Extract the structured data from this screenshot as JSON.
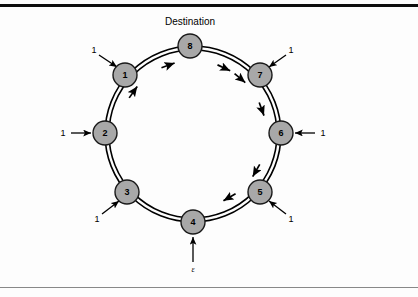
{
  "figure": {
    "caption": {
      "text": "Destination",
      "x": 190,
      "y": 22
    },
    "rules": {
      "top_color": "#0d0d0d",
      "bottom_color": "#888888"
    },
    "style": {
      "node_fill": "#a8a8a8",
      "node_stroke": "#1a1a1a",
      "ring_stroke": "#000000",
      "arrow_color": "#000000",
      "background": "#fdfdfd"
    },
    "ring": {
      "center_x": 193,
      "center_y": 134,
      "radius": 88,
      "inner_radius": 84,
      "direction": "counterclockwise",
      "double_line": true
    },
    "nodes": [
      {
        "id": "1",
        "label": "1",
        "x": 125,
        "y": 75,
        "r": 12
      },
      {
        "id": "2",
        "label": "2",
        "x": 105,
        "y": 133,
        "r": 12
      },
      {
        "id": "3",
        "label": "3",
        "x": 127,
        "y": 192,
        "r": 12
      },
      {
        "id": "4",
        "label": "4",
        "x": 193,
        "y": 222,
        "r": 12
      },
      {
        "id": "5",
        "label": "5",
        "x": 260,
        "y": 192,
        "r": 12
      },
      {
        "id": "6",
        "label": "6",
        "x": 281,
        "y": 133,
        "r": 12
      },
      {
        "id": "7",
        "label": "7",
        "x": 260,
        "y": 75,
        "r": 12
      },
      {
        "id": "8",
        "label": "8",
        "x": 190,
        "y": 46,
        "r": 12
      }
    ],
    "inputs": [
      {
        "node": "1",
        "label": "1",
        "label_x": 94,
        "label_y": 50,
        "from_x": 99,
        "from_y": 55,
        "to_x": 117,
        "to_y": 67
      },
      {
        "node": "2",
        "label": "1",
        "label_x": 63,
        "label_y": 133,
        "from_x": 71,
        "from_y": 133,
        "to_x": 91,
        "to_y": 133
      },
      {
        "node": "3",
        "label": "1",
        "label_x": 97,
        "label_y": 219,
        "from_x": 102,
        "from_y": 214,
        "to_x": 119,
        "to_y": 201
      },
      {
        "node": "4",
        "label": "ε",
        "label_x": 193,
        "label_y": 270,
        "from_x": 193,
        "from_y": 262,
        "to_x": 193,
        "to_y": 237
      },
      {
        "node": "5",
        "label": "1",
        "label_x": 291,
        "label_y": 219,
        "from_x": 286,
        "from_y": 214,
        "to_x": 269,
        "to_y": 201
      },
      {
        "node": "6",
        "label": "1",
        "label_x": 323,
        "label_y": 133,
        "from_x": 315,
        "from_y": 133,
        "to_x": 295,
        "to_y": 133
      },
      {
        "node": "7",
        "label": "1",
        "label_x": 291,
        "label_y": 50,
        "from_x": 286,
        "from_y": 55,
        "to_x": 269,
        "to_y": 67
      }
    ],
    "flow_arrows": [
      {
        "from": "1",
        "to": "8",
        "angle_deg": 310
      },
      {
        "from": "2",
        "to": "1",
        "angle_deg": 250
      },
      {
        "from": "3",
        "to": "2",
        "angle_deg": 215
      },
      {
        "from": "4",
        "to": "5",
        "angle_deg": 60
      },
      {
        "from": "5",
        "to": "6",
        "angle_deg": 30
      },
      {
        "from": "6",
        "to": "7",
        "angle_deg": 340
      },
      {
        "from": "7",
        "to": "8",
        "angle_deg": 295
      }
    ]
  }
}
